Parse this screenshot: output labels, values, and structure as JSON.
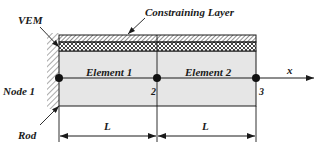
{
  "diagram": {
    "labels": {
      "constraining_layer": "Constraining Layer",
      "vem": "VEM",
      "rod": "Rod",
      "node1": "Node 1",
      "element1": "Element 1",
      "element2": "Element 2",
      "node2": "2",
      "node3": "3",
      "axis": "x",
      "length1": "L",
      "length2": "L"
    },
    "colors": {
      "rod_fill": "#e6e6e6",
      "stroke": "#1a1a1a",
      "background": "#ffffff"
    }
  }
}
